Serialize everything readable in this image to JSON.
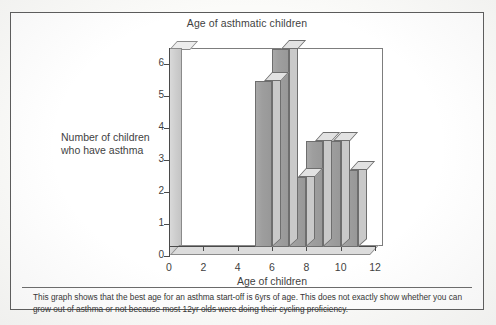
{
  "chart_data": {
    "type": "bar",
    "title": "Age of asthmatic children",
    "xlabel": "Age of children",
    "ylabel": "Number of children who have asthma",
    "categories": [
      5,
      6,
      7,
      8,
      9,
      10
    ],
    "values": [
      5.2,
      6.2,
      2.2,
      3.3,
      3.3,
      2.4
    ],
    "x_ticks": [
      0,
      2,
      4,
      6,
      8,
      10,
      12
    ],
    "y_ticks": [
      0,
      1,
      2,
      3,
      4,
      5,
      6
    ],
    "xlim": [
      0,
      12
    ],
    "ylim": [
      0,
      6.5
    ],
    "grid": false,
    "legend": "none",
    "style": "3d-bar",
    "bar_color": "#9e9e9e",
    "bar_top_color": "#e2e2e2",
    "bar_side_color": "#c9c9c9"
  },
  "caption": {
    "text": "This graph shows that the best age for an asthma start-off is 6yrs of age. This does not exactly show whether you can grow out of asthma or not because most 12yr olds were doing their cycling proficiency."
  }
}
